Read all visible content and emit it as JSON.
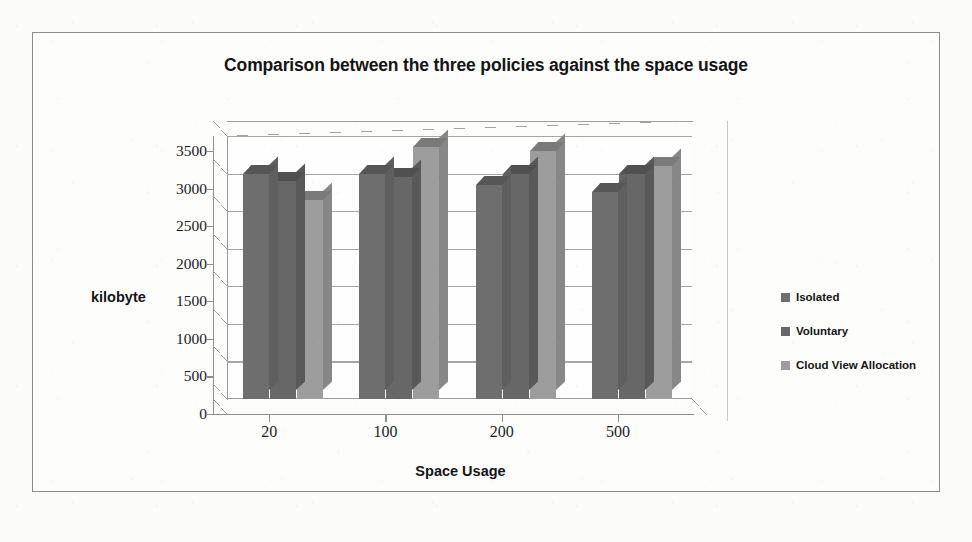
{
  "chart_data": {
    "type": "bar",
    "title": "Comparison between the three policies against the space usage",
    "xlabel": "Space Usage",
    "ylabel": "kilobyte",
    "categories": [
      "20",
      "100",
      "200",
      "500"
    ],
    "ylim": [
      0,
      3500
    ],
    "yticks": [
      0,
      500,
      1000,
      1500,
      2000,
      2500,
      3000,
      3500
    ],
    "ytick_labels": [
      "0",
      "500",
      "1000",
      "1500",
      "2000",
      "2500",
      "3000",
      "3500"
    ],
    "grid": true,
    "legend_position": "right",
    "three_d": true,
    "series": [
      {
        "name": "Isolated",
        "color": "#6e6e6e",
        "values": [
          3000,
          3000,
          2850,
          2750
        ]
      },
      {
        "name": "Voluntary",
        "color": "#676767",
        "values": [
          2900,
          2950,
          3000,
          3000
        ]
      },
      {
        "name": "Cloud View Allocation",
        "color": "#9d9d9d",
        "values": [
          2650,
          3350,
          3300,
          3100
        ]
      }
    ]
  },
  "frame": {
    "border_color": "#8e8e8e",
    "background": "#fdfdfc"
  }
}
